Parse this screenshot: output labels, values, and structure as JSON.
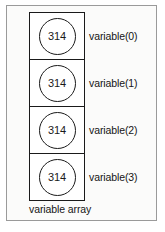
{
  "figure": {
    "caption": "variable array",
    "frame_color": "#9a9a9a",
    "background_color": "#fbfbfa",
    "stroke_color": "#1a1a1a"
  },
  "array": {
    "cells": [
      {
        "value": "314",
        "label": "variable(0)"
      },
      {
        "value": "314",
        "label": "variable(1)"
      },
      {
        "value": "314",
        "label": "variable(2)"
      },
      {
        "value": "314",
        "label": "variable(3)"
      }
    ]
  }
}
